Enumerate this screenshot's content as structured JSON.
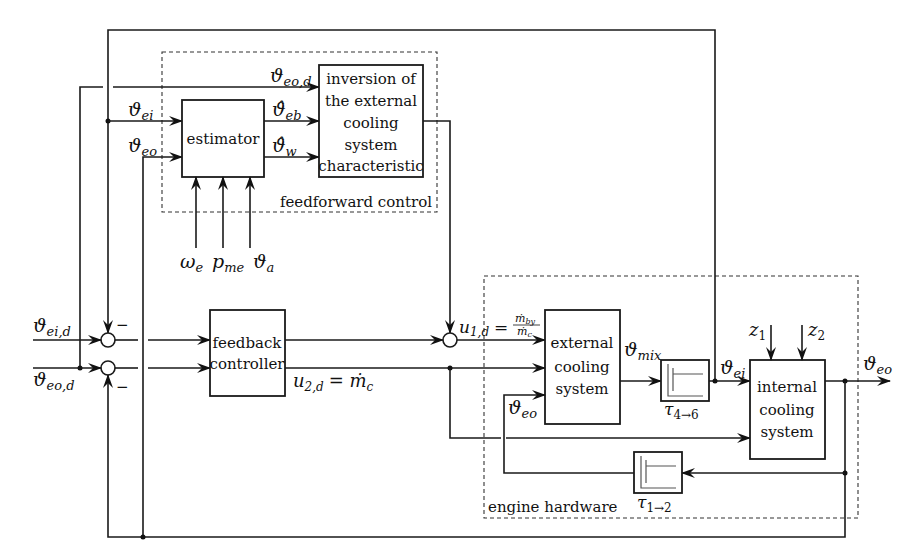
{
  "diagram": {
    "groups": {
      "feedforward": "feedforward control",
      "hardware": "engine hardware"
    },
    "blocks": {
      "estimator": [
        "estimator"
      ],
      "inversion": [
        "inversion of",
        "the external",
        "cooling",
        "system",
        "characteristic"
      ],
      "feedback": [
        "feedback",
        "controller"
      ],
      "external": [
        "external",
        "cooling",
        "system"
      ],
      "internal": [
        "internal",
        "cooling",
        "system"
      ]
    },
    "delays": {
      "tau46": {
        "sym": "τ",
        "sub": "4→6"
      },
      "tau12": {
        "sym": "τ",
        "sub": "1→2"
      }
    },
    "signals": {
      "theta_eo_d_top": {
        "sym": "ϑ",
        "sub": "eo,d"
      },
      "theta_ei_top": {
        "sym": "ϑ",
        "sub": "ei"
      },
      "theta_eo_top": {
        "sym": "ϑ",
        "sub": "eo"
      },
      "theta_eb_hat": {
        "sym": "ϑ̂",
        "sub": "eb"
      },
      "theta_w_hat": {
        "sym": "ϑ̂",
        "sub": "w"
      },
      "omega_e": {
        "sym": "ω",
        "sub": "e"
      },
      "p_me": {
        "sym": "p",
        "sub": "me"
      },
      "theta_a": {
        "sym": "ϑ",
        "sub": "a"
      },
      "theta_ei_d": {
        "sym": "ϑ",
        "sub": "ei,d"
      },
      "theta_eo_d": {
        "sym": "ϑ",
        "sub": "eo,d"
      },
      "u1d": {
        "sym": "u",
        "sub": "1,d",
        "eq": "=",
        "num": "ṁ",
        "num_sub": "by",
        "den": "ṁ",
        "den_sub": "c"
      },
      "u2d": {
        "sym": "u",
        "sub": "2,d",
        "eq": "= ṁ",
        "rhs_sub": "c"
      },
      "theta_mix": {
        "sym": "ϑ",
        "sub": "mix"
      },
      "theta_ei_hw": {
        "sym": "ϑ",
        "sub": "ei"
      },
      "theta_eo_hw": {
        "sym": "ϑ",
        "sub": "eo"
      },
      "theta_eo_out": {
        "sym": "ϑ",
        "sub": "eo"
      },
      "z1": {
        "sym": "z",
        "sub": "1"
      },
      "z2": {
        "sym": "z",
        "sub": "2"
      }
    },
    "signs": {
      "minus": "−"
    }
  }
}
